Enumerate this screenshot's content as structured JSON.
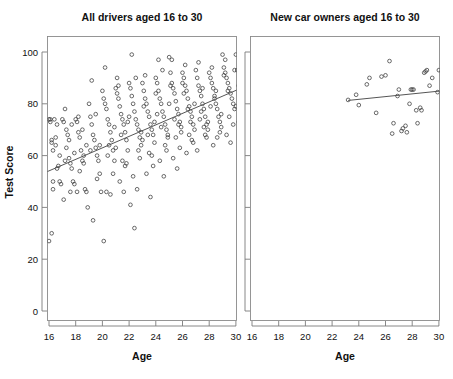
{
  "figure": {
    "background_color": "#ffffff",
    "point_color": "#3a3a3a",
    "line_color": "#555555",
    "axis_color": "#7b7b7b"
  },
  "chart_data": {
    "type": "scatter",
    "title": "",
    "panels": [
      {
        "id": "left",
        "title": "All drivers aged 16 to 30",
        "xlabel": "Age",
        "ylabel": "Test Score",
        "xlim": [
          15.5,
          30.6
        ],
        "ylim": [
          0,
          105
        ],
        "xticks": [
          16,
          18,
          20,
          22,
          24,
          26,
          28,
          30
        ],
        "yticks": [
          0,
          20,
          40,
          60,
          80,
          100
        ],
        "grid": false,
        "legend": "none",
        "fit_line": {
          "x": [
            15.5,
            30.6
          ],
          "y": [
            53.0,
            86.5
          ],
          "label": "linear fit"
        },
        "points": [
          [
            16.0,
            74
          ],
          [
            16.1,
            73
          ],
          [
            16.1,
            74
          ],
          [
            16.2,
            66
          ],
          [
            16.2,
            65
          ],
          [
            16.3,
            50
          ],
          [
            16.3,
            47
          ],
          [
            16.0,
            27
          ],
          [
            16.2,
            30
          ],
          [
            16.4,
            74
          ],
          [
            16.5,
            64
          ],
          [
            16.5,
            67
          ],
          [
            16.6,
            55
          ],
          [
            16.7,
            56
          ],
          [
            16.8,
            50
          ],
          [
            16.9,
            49
          ],
          [
            16.3,
            62
          ],
          [
            16.6,
            72
          ],
          [
            16.8,
            60
          ],
          [
            17.0,
            74
          ],
          [
            17.1,
            73
          ],
          [
            17.2,
            78
          ],
          [
            17.3,
            70
          ],
          [
            17.4,
            68
          ],
          [
            17.5,
            59
          ],
          [
            17.6,
            57
          ],
          [
            17.7,
            55
          ],
          [
            17.8,
            50
          ],
          [
            17.9,
            49
          ],
          [
            17.1,
            43
          ],
          [
            17.3,
            63
          ],
          [
            17.5,
            66
          ],
          [
            17.7,
            72
          ],
          [
            17.9,
            61
          ],
          [
            17.2,
            58
          ],
          [
            17.6,
            46
          ],
          [
            18.0,
            74
          ],
          [
            18.1,
            73
          ],
          [
            18.2,
            69
          ],
          [
            18.3,
            67
          ],
          [
            18.4,
            62
          ],
          [
            18.5,
            58
          ],
          [
            18.6,
            57
          ],
          [
            18.7,
            47
          ],
          [
            18.8,
            46
          ],
          [
            18.9,
            40
          ],
          [
            18.2,
            75
          ],
          [
            18.5,
            70
          ],
          [
            18.8,
            64
          ],
          [
            18.3,
            54
          ],
          [
            18.6,
            60
          ],
          [
            18.1,
            46
          ],
          [
            19.0,
            80
          ],
          [
            19.1,
            75
          ],
          [
            19.2,
            72
          ],
          [
            19.3,
            68
          ],
          [
            19.4,
            66
          ],
          [
            19.5,
            63
          ],
          [
            19.6,
            60
          ],
          [
            19.7,
            58
          ],
          [
            19.8,
            53
          ],
          [
            19.9,
            46
          ],
          [
            19.2,
            89
          ],
          [
            19.5,
            76
          ],
          [
            19.8,
            64
          ],
          [
            19.3,
            35
          ],
          [
            19.6,
            51
          ],
          [
            19.1,
            62
          ],
          [
            20.0,
            85
          ],
          [
            20.1,
            82
          ],
          [
            20.2,
            80
          ],
          [
            20.3,
            78
          ],
          [
            20.4,
            74
          ],
          [
            20.5,
            72
          ],
          [
            20.6,
            69
          ],
          [
            20.7,
            66
          ],
          [
            20.8,
            62
          ],
          [
            20.9,
            58
          ],
          [
            20.2,
            94
          ],
          [
            20.5,
            64
          ],
          [
            20.8,
            53
          ],
          [
            20.3,
            46
          ],
          [
            20.6,
            45
          ],
          [
            20.1,
            27
          ],
          [
            20.4,
            60
          ],
          [
            20.9,
            71
          ],
          [
            21.0,
            86
          ],
          [
            21.1,
            84
          ],
          [
            21.2,
            82
          ],
          [
            21.3,
            79
          ],
          [
            21.4,
            76
          ],
          [
            21.5,
            74
          ],
          [
            21.6,
            72
          ],
          [
            21.7,
            69
          ],
          [
            21.8,
            66
          ],
          [
            21.9,
            62
          ],
          [
            21.2,
            87
          ],
          [
            21.5,
            58
          ],
          [
            21.8,
            57
          ],
          [
            21.3,
            50
          ],
          [
            21.6,
            46
          ],
          [
            21.1,
            90
          ],
          [
            21.4,
            68
          ],
          [
            21.9,
            73
          ],
          [
            21.7,
            56
          ],
          [
            21.0,
            63
          ],
          [
            22.0,
            88
          ],
          [
            22.1,
            86
          ],
          [
            22.2,
            83
          ],
          [
            22.3,
            80
          ],
          [
            22.4,
            77
          ],
          [
            22.5,
            74
          ],
          [
            22.6,
            72
          ],
          [
            22.7,
            70
          ],
          [
            22.8,
            67
          ],
          [
            22.9,
            64
          ],
          [
            22.2,
            99
          ],
          [
            22.5,
            90
          ],
          [
            22.8,
            59
          ],
          [
            22.3,
            52
          ],
          [
            22.6,
            47
          ],
          [
            22.1,
            41
          ],
          [
            22.4,
            32
          ],
          [
            22.9,
            69
          ],
          [
            22.7,
            62
          ],
          [
            22.0,
            75
          ],
          [
            23.0,
            88
          ],
          [
            23.1,
            85
          ],
          [
            23.2,
            82
          ],
          [
            23.3,
            80
          ],
          [
            23.4,
            77
          ],
          [
            23.5,
            75
          ],
          [
            23.6,
            72
          ],
          [
            23.7,
            70
          ],
          [
            23.8,
            68
          ],
          [
            23.9,
            65
          ],
          [
            23.2,
            91
          ],
          [
            23.5,
            61
          ],
          [
            23.8,
            56
          ],
          [
            23.3,
            53
          ],
          [
            23.6,
            44
          ],
          [
            23.1,
            79
          ],
          [
            23.4,
            68
          ],
          [
            23.9,
            73
          ],
          [
            23.7,
            60
          ],
          [
            23.0,
            66
          ],
          [
            24.0,
            90
          ],
          [
            24.1,
            88
          ],
          [
            24.2,
            85
          ],
          [
            24.3,
            82
          ],
          [
            24.4,
            80
          ],
          [
            24.5,
            77
          ],
          [
            24.6,
            75
          ],
          [
            24.7,
            72
          ],
          [
            24.8,
            70
          ],
          [
            24.9,
            67
          ],
          [
            24.2,
            97
          ],
          [
            24.5,
            93
          ],
          [
            24.8,
            62
          ],
          [
            24.3,
            58
          ],
          [
            24.6,
            52
          ],
          [
            24.1,
            76
          ],
          [
            24.4,
            71
          ],
          [
            24.9,
            68
          ],
          [
            24.7,
            64
          ],
          [
            24.0,
            84
          ],
          [
            25.0,
            98
          ],
          [
            25.1,
            92
          ],
          [
            25.2,
            88
          ],
          [
            25.3,
            86
          ],
          [
            25.4,
            84
          ],
          [
            25.5,
            81
          ],
          [
            25.6,
            78
          ],
          [
            25.7,
            76
          ],
          [
            25.8,
            73
          ],
          [
            25.9,
            71
          ],
          [
            25.2,
            97
          ],
          [
            25.5,
            67
          ],
          [
            25.8,
            63
          ],
          [
            25.3,
            59
          ],
          [
            25.6,
            55
          ],
          [
            25.1,
            87
          ],
          [
            25.4,
            74
          ],
          [
            25.9,
            69
          ],
          [
            25.7,
            72
          ],
          [
            25.0,
            80
          ],
          [
            26.0,
            92
          ],
          [
            26.1,
            90
          ],
          [
            26.2,
            87
          ],
          [
            26.3,
            85
          ],
          [
            26.4,
            82
          ],
          [
            26.5,
            79
          ],
          [
            26.6,
            77
          ],
          [
            26.7,
            75
          ],
          [
            26.8,
            72
          ],
          [
            26.9,
            70
          ],
          [
            26.2,
            95
          ],
          [
            26.5,
            68
          ],
          [
            26.8,
            65
          ],
          [
            26.3,
            61
          ],
          [
            26.6,
            73
          ],
          [
            26.1,
            84
          ],
          [
            26.4,
            78
          ],
          [
            26.9,
            80
          ],
          [
            26.7,
            66
          ],
          [
            26.0,
            88
          ],
          [
            27.0,
            93
          ],
          [
            27.1,
            90
          ],
          [
            27.2,
            87
          ],
          [
            27.3,
            85
          ],
          [
            27.4,
            83
          ],
          [
            27.5,
            80
          ],
          [
            27.6,
            78
          ],
          [
            27.7,
            75
          ],
          [
            27.8,
            72
          ],
          [
            27.9,
            70
          ],
          [
            27.2,
            96
          ],
          [
            27.5,
            86
          ],
          [
            27.8,
            67
          ],
          [
            27.3,
            74
          ],
          [
            27.6,
            71
          ],
          [
            27.1,
            62
          ],
          [
            27.4,
            77
          ],
          [
            27.9,
            73
          ],
          [
            27.7,
            68
          ],
          [
            28.0,
            92
          ],
          [
            28.1,
            90
          ],
          [
            28.2,
            88
          ],
          [
            28.3,
            86
          ],
          [
            28.4,
            83
          ],
          [
            28.5,
            80
          ],
          [
            28.6,
            78
          ],
          [
            28.7,
            75
          ],
          [
            28.8,
            73
          ],
          [
            28.9,
            71
          ],
          [
            28.2,
            94
          ],
          [
            28.5,
            85
          ],
          [
            28.8,
            69
          ],
          [
            28.3,
            64
          ],
          [
            28.6,
            67
          ],
          [
            28.1,
            79
          ],
          [
            28.4,
            82
          ],
          [
            28.9,
            76
          ],
          [
            29.0,
            99
          ],
          [
            29.1,
            94
          ],
          [
            29.2,
            92
          ],
          [
            29.3,
            90
          ],
          [
            29.4,
            88
          ],
          [
            29.5,
            86
          ],
          [
            29.6,
            84
          ],
          [
            29.7,
            82
          ],
          [
            29.8,
            80
          ],
          [
            29.9,
            78
          ],
          [
            29.2,
            97
          ],
          [
            29.5,
            75
          ],
          [
            29.8,
            72
          ],
          [
            29.3,
            68
          ],
          [
            29.6,
            65
          ],
          [
            29.1,
            91
          ],
          [
            29.4,
            85
          ],
          [
            29.9,
            93
          ],
          [
            30.0,
            99
          ],
          [
            30.1,
            93
          ],
          [
            30.2,
            87
          ],
          [
            30.3,
            84
          ],
          [
            30.0,
            79
          ],
          [
            30.2,
            73
          ]
        ]
      },
      {
        "id": "right",
        "title": "New car owners aged 16 to 30",
        "xlabel": "Age",
        "ylabel": "",
        "xlim": [
          15.5,
          30.6
        ],
        "ylim": [
          0,
          105
        ],
        "xticks": [
          16,
          18,
          20,
          22,
          24,
          26,
          28,
          30
        ],
        "yticks": [
          0,
          20,
          40,
          60,
          80,
          100
        ],
        "grid": false,
        "legend": "none",
        "fit_line": {
          "x": [
            23.2,
            30.6
          ],
          "y": [
            81.3,
            85.2
          ],
          "label": "linear fit"
        },
        "points": [
          [
            23.2,
            81.5
          ],
          [
            23.8,
            83.5
          ],
          [
            24.0,
            79.5
          ],
          [
            24.6,
            87.5
          ],
          [
            24.8,
            90.0
          ],
          [
            25.3,
            76.5
          ],
          [
            25.7,
            90.5
          ],
          [
            26.0,
            91.0
          ],
          [
            26.3,
            96.5
          ],
          [
            26.5,
            68.5
          ],
          [
            26.6,
            72.5
          ],
          [
            26.9,
            83.0
          ],
          [
            27.0,
            85.5
          ],
          [
            27.2,
            69.5
          ],
          [
            27.3,
            70.5
          ],
          [
            27.5,
            71.5
          ],
          [
            27.6,
            69.0
          ],
          [
            27.8,
            80.0
          ],
          [
            27.9,
            85.5
          ],
          [
            28.0,
            85.5
          ],
          [
            28.1,
            85.5
          ],
          [
            28.3,
            77.5
          ],
          [
            28.4,
            72.5
          ],
          [
            28.6,
            78.5
          ],
          [
            28.7,
            77.5
          ],
          [
            28.9,
            92.0
          ],
          [
            29.0,
            92.5
          ],
          [
            29.1,
            93.0
          ],
          [
            29.3,
            87.0
          ],
          [
            29.5,
            90.0
          ],
          [
            29.9,
            84.5
          ],
          [
            30.0,
            93.0
          ],
          [
            30.2,
            92.5
          ]
        ]
      }
    ]
  }
}
